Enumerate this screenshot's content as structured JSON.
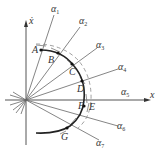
{
  "diagram": {
    "title": "",
    "axes": {
      "vertical_label": "ẋ",
      "horizontal_label": "x"
    },
    "rays": [
      {
        "id": "a1",
        "symbol": "α",
        "index": "1"
      },
      {
        "id": "a2",
        "symbol": "α",
        "index": "2"
      },
      {
        "id": "a3",
        "symbol": "α",
        "index": "3"
      },
      {
        "id": "a4",
        "symbol": "α",
        "index": "4"
      },
      {
        "id": "a5",
        "symbol": "α",
        "index": "5"
      },
      {
        "id": "a6",
        "symbol": "α",
        "index": "6"
      },
      {
        "id": "a7",
        "symbol": "α",
        "index": "7"
      }
    ],
    "points": {
      "A": "A",
      "B": "B",
      "C": "C",
      "D": "D",
      "E": "E",
      "F": "F",
      "G": "G"
    },
    "colors": {
      "axis": "#555555",
      "ray": "#666666",
      "arc": "#222222",
      "label": "#333333"
    }
  }
}
